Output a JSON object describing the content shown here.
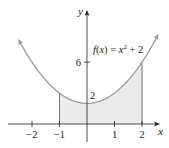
{
  "chart_data": {
    "type": "line",
    "title": "",
    "function_label": "f(x) = x^2 + 2",
    "function_label_parts": {
      "lhs": "f(x) = x",
      "exp": "2",
      "rhs": " + 2"
    },
    "xlabel": "x",
    "ylabel": "y",
    "x_ticks": [
      {
        "value": -2,
        "label": "−2"
      },
      {
        "value": -1,
        "label": "−1"
      },
      {
        "value": 1,
        "label": "1"
      },
      {
        "value": 2,
        "label": "2"
      }
    ],
    "y_ticks": [
      {
        "value": 2,
        "label": "2"
      },
      {
        "value": 6,
        "label": "6"
      }
    ],
    "xlim": [
      -3,
      3
    ],
    "ylim": [
      0,
      9
    ],
    "grid": false,
    "series": [
      {
        "name": "f(x) = x^2 + 2",
        "x": [
          -2.5,
          -2,
          -1,
          0,
          1,
          2,
          2.5
        ],
        "y": [
          8.25,
          6,
          3,
          2,
          3,
          6,
          8.25
        ]
      }
    ],
    "shaded_region": {
      "from_x": -1,
      "to_x": 2,
      "description": "area under f(x) between x = -1 and x = 2"
    },
    "colors": {
      "curve": "#9a9a9a",
      "shade": "#ebebeb",
      "axes": "#222222"
    }
  }
}
